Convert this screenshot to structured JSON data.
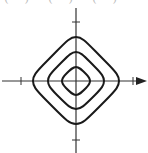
{
  "top_fragments": [
    "( )",
    "( )",
    "( )"
  ],
  "diagram": {
    "axes": {
      "origin": [
        76,
        81
      ],
      "x_axis": {
        "from": 2,
        "to": 147,
        "arrow": true,
        "ticks": [
          21,
          133
        ]
      },
      "y_axis": {
        "from": 8,
        "to": 153,
        "arrow": false,
        "ticks": [
          22,
          140
        ]
      }
    },
    "contours": [
      {
        "name": "inner",
        "half_width": 14
      },
      {
        "name": "middle",
        "half_width": 28
      },
      {
        "name": "outer",
        "half_width": 43
      }
    ],
    "stroke_color": "#1a1a1a",
    "axis_color": "#333333"
  }
}
